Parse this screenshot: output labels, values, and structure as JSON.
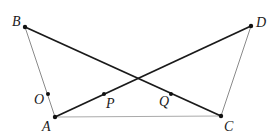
{
  "diagram": {
    "type": "geometry-figure",
    "points": {
      "A": {
        "label": "A",
        "x": 55,
        "y": 117,
        "label_x": 42,
        "label_y": 131
      },
      "B": {
        "label": "B",
        "x": 25,
        "y": 27,
        "label_x": 12,
        "label_y": 26
      },
      "C": {
        "label": "C",
        "x": 221,
        "y": 116,
        "label_x": 224,
        "label_y": 131
      },
      "D": {
        "label": "D",
        "x": 251,
        "y": 26,
        "label_x": 256,
        "label_y": 27
      },
      "O": {
        "label": "O",
        "x": 48,
        "y": 94,
        "label_x": 34,
        "label_y": 104
      },
      "P": {
        "label": "P",
        "x": 104,
        "y": 94,
        "label_x": 106,
        "label_y": 108
      },
      "Q": {
        "label": "Q",
        "x": 171,
        "y": 94,
        "label_x": 159,
        "label_y": 106
      }
    },
    "segments": [
      {
        "from": "B",
        "to": "C",
        "style": "bold"
      },
      {
        "from": "A",
        "to": "D",
        "style": "bold"
      },
      {
        "from": "A",
        "to": "B",
        "style": "thin"
      },
      {
        "from": "C",
        "to": "D",
        "style": "thin"
      },
      {
        "from": "A",
        "to": "C",
        "style": "thin"
      }
    ],
    "colors": {
      "bold_line": "#1a1a1a",
      "thin_line": "#8a8a8a",
      "point": "#111111",
      "label": "#1a1a1a"
    }
  }
}
